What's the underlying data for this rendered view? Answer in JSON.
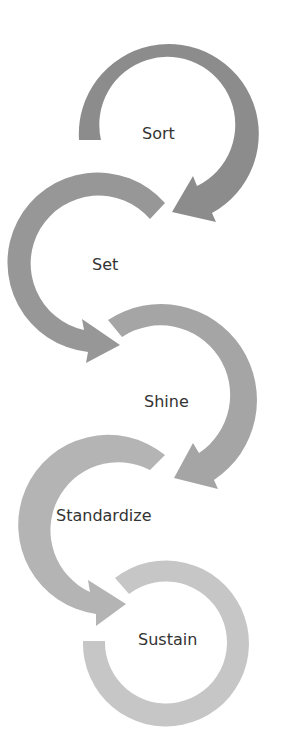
{
  "diagram": {
    "type": "cyclical-arrow-process",
    "steps": [
      {
        "label": "Sort",
        "color": "#8c8c8c"
      },
      {
        "label": "Set",
        "color": "#979797"
      },
      {
        "label": "Shine",
        "color": "#a5a5a5"
      },
      {
        "label": "Standardize",
        "color": "#b4b4b4"
      },
      {
        "label": "Sustain",
        "color": "#c6c6c6"
      }
    ],
    "text_color": "#333333",
    "background": "#ffffff"
  }
}
